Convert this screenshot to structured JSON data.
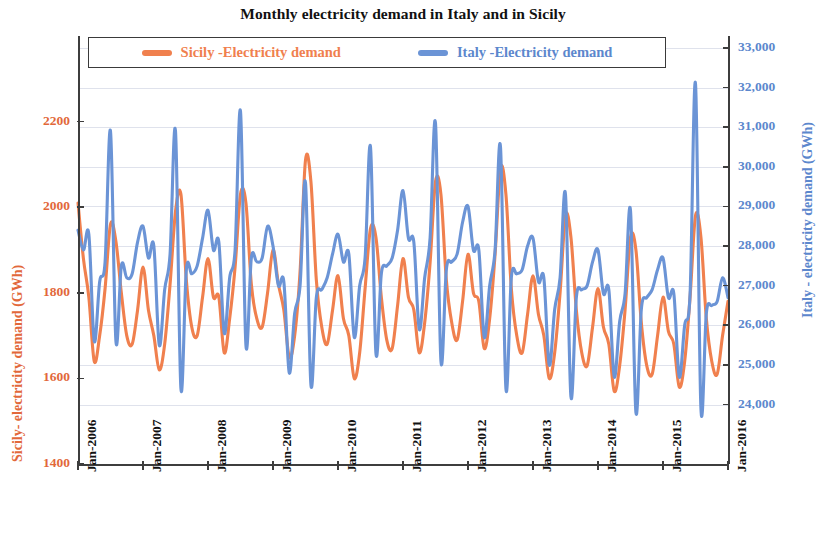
{
  "chart_data": {
    "type": "line",
    "title": "Monthly electricity demand in Italy and in Sicily",
    "xlabel": "",
    "grid": true,
    "legend_position": "top-inside",
    "colors": {
      "sicily": "#F0804E",
      "italy": "#6B94D6",
      "axis": "#3D3D3D",
      "grid": "#DFE2EC",
      "title": "#111111"
    },
    "axes": {
      "left": {
        "name": "Sicily- electricity demand (GWh)",
        "ticks": [
          1400,
          1600,
          1800,
          2000,
          2200
        ],
        "tick_labels": [
          "1400",
          "1600",
          "1800",
          "2000",
          "2200"
        ],
        "ylim": [
          1400,
          2400
        ],
        "color": "#E2683A"
      },
      "right": {
        "name": "Italy - electricity demand (GWh)",
        "ticks": [
          24000,
          25000,
          26000,
          27000,
          28000,
          29000,
          30000,
          31000,
          32000,
          33000
        ],
        "tick_labels": [
          "24,000",
          "25,000",
          "26,000",
          "27,000",
          "28,000",
          "29,000",
          "30,000",
          "31,000",
          "32,000",
          "33,000"
        ],
        "ylim": [
          22500,
          33300
        ],
        "color": "#5C87CD"
      },
      "bottom": {
        "tick_labels": [
          "Jan-2006",
          "Jan-2007",
          "Jan-2008",
          "Jan-2009",
          "Jan-2010",
          "Jan-2011",
          "Jan-2012",
          "Jan-2013",
          "Jan-2014",
          "Jan-2015",
          "Jan-2016"
        ],
        "tick_indices": [
          0,
          12,
          24,
          36,
          48,
          60,
          72,
          84,
          96,
          108,
          120
        ]
      }
    },
    "series": [
      {
        "name": "Sicily -Electricity demand",
        "axis": "left",
        "color": "#F0804E",
        "values": [
          2010,
          1880,
          1790,
          1640,
          1700,
          1810,
          1960,
          1920,
          1800,
          1700,
          1680,
          1760,
          1860,
          1760,
          1700,
          1620,
          1680,
          1820,
          1990,
          2030,
          1830,
          1720,
          1700,
          1790,
          1880,
          1790,
          1790,
          1660,
          1740,
          1860,
          2030,
          2010,
          1820,
          1740,
          1720,
          1800,
          1900,
          1820,
          1760,
          1650,
          1700,
          1850,
          2110,
          2060,
          1830,
          1720,
          1680,
          1760,
          1840,
          1740,
          1700,
          1600,
          1660,
          1810,
          1950,
          1930,
          1790,
          1690,
          1670,
          1770,
          1880,
          1790,
          1760,
          1660,
          1730,
          1870,
          2060,
          2030,
          1830,
          1730,
          1690,
          1780,
          1890,
          1800,
          1780,
          1670,
          1740,
          1890,
          2090,
          2030,
          1810,
          1700,
          1660,
          1750,
          1840,
          1750,
          1700,
          1600,
          1660,
          1800,
          1980,
          1930,
          1760,
          1660,
          1630,
          1720,
          1810,
          1720,
          1680,
          1570,
          1630,
          1760,
          1930,
          1900,
          1730,
          1630,
          1610,
          1700,
          1790,
          1710,
          1680,
          1580,
          1640,
          1790,
          1980,
          1930,
          1740,
          1640,
          1610,
          1700,
          1780
        ],
        "label_first": "Jan-2006",
        "label_last": "Jan-2016"
      },
      {
        "name": "Italy -Electricity demand",
        "axis": "right",
        "color": "#6B94D6",
        "values": [
          28400,
          27900,
          28300,
          25600,
          27100,
          27600,
          30900,
          25600,
          27500,
          27200,
          27300,
          28100,
          28500,
          27700,
          28000,
          25500,
          26900,
          27800,
          30900,
          24400,
          27400,
          27300,
          27500,
          28200,
          28900,
          27900,
          28100,
          25800,
          27200,
          27900,
          31400,
          25500,
          27700,
          27600,
          27700,
          28500,
          28000,
          27000,
          27100,
          24800,
          26300,
          27000,
          29600,
          24500,
          26700,
          26900,
          27200,
          27800,
          28300,
          27600,
          27800,
          25700,
          27000,
          27700,
          30500,
          25300,
          27300,
          27500,
          27700,
          28400,
          29400,
          28200,
          28100,
          25900,
          27200,
          28200,
          31100,
          25100,
          27400,
          27600,
          27800,
          28600,
          29000,
          27900,
          27900,
          25700,
          27000,
          27900,
          30500,
          24400,
          27200,
          27300,
          27400,
          28000,
          28200,
          27100,
          27200,
          25000,
          26400,
          27200,
          29300,
          24200,
          26700,
          26900,
          27000,
          27600,
          27900,
          26800,
          26900,
          24700,
          26100,
          26800,
          28900,
          23800,
          26400,
          26700,
          26900,
          27400,
          27700,
          26700,
          26800,
          24700,
          26000,
          26800,
          32100,
          23900,
          26300,
          26500,
          26600,
          27200,
          26700
        ],
        "label_first": "Jan-2006",
        "label_last": "Jan-2016"
      }
    ]
  },
  "legend": {
    "entries": [
      {
        "label": "Sicily -Electricity demand",
        "color": "#F0804E"
      },
      {
        "label": "Italy -Electricity demand",
        "color": "#6B94D6"
      }
    ]
  }
}
